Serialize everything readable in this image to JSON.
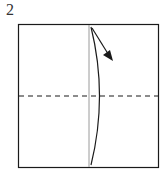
{
  "diagram": {
    "step_number": "2",
    "elements": {
      "paper": "square",
      "center_crease": "vertical solid gray line",
      "fold_line": "horizontal dashed line",
      "flap_edge": "curved line",
      "arrow": "fold direction arrow"
    },
    "colors": {
      "outline": "#1a1a1a",
      "crease": "#9a9a9a",
      "background": "#ffffff"
    }
  }
}
